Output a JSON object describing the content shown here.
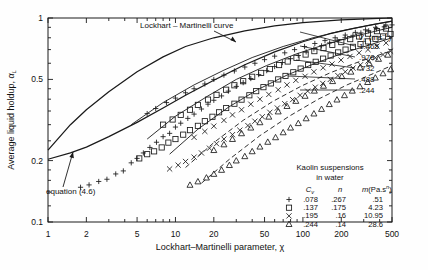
{
  "chart_data": {
    "type": "scatter",
    "title": "",
    "xlabel": "Lockhart–Martinelli parameter, χ",
    "ylabel": "Average liquid holdup, αL",
    "xscale": "log",
    "yscale": "log",
    "xlim": [
      1,
      500
    ],
    "ylim": [
      0.1,
      1
    ],
    "grid": false,
    "xticks": [
      1,
      2,
      5,
      10,
      20,
      50,
      100,
      200,
      500
    ],
    "xtick_labels": [
      "1",
      "2",
      "5",
      "10",
      "20",
      "50",
      "100",
      "200",
      "500"
    ],
    "yticks": [
      0.1,
      0.2,
      0.5,
      1
    ],
    "ytick_labels": [
      "0.1",
      "0.2",
      "0.5",
      "1"
    ],
    "annotations": [
      {
        "text": "Lockhart – Martinelli curve",
        "x": 3.2,
        "y": 0.82
      },
      {
        "text": "equation (4.6)",
        "x": 1.9,
        "y": 0.145
      }
    ],
    "reference_curves": [
      {
        "name": "Lockhart-Martinelli curve",
        "points": [
          [
            1,
            0.225
          ],
          [
            1.5,
            0.3
          ],
          [
            2,
            0.355
          ],
          [
            3,
            0.435
          ],
          [
            5,
            0.545
          ],
          [
            8,
            0.645
          ],
          [
            12,
            0.725
          ],
          [
            20,
            0.8
          ],
          [
            35,
            0.865
          ],
          [
            60,
            0.915
          ],
          [
            100,
            0.95
          ],
          [
            200,
            0.978
          ],
          [
            350,
            0.992
          ],
          [
            500,
            1.0
          ]
        ]
      },
      {
        "name": "equation (4.6)",
        "points": [
          [
            1,
            0.203
          ],
          [
            1.5,
            0.218
          ],
          [
            2,
            0.233
          ],
          [
            3,
            0.262
          ],
          [
            5,
            0.308
          ],
          [
            8,
            0.362
          ],
          [
            12,
            0.418
          ],
          [
            20,
            0.495
          ],
          [
            35,
            0.59
          ],
          [
            60,
            0.682
          ],
          [
            100,
            0.765
          ],
          [
            160,
            0.835
          ],
          [
            250,
            0.89
          ],
          [
            360,
            0.93
          ],
          [
            500,
            0.965
          ]
        ]
      }
    ],
    "series": [
      {
        "name": "Cv = .078",
        "marker": "plus",
        "n": ".267",
        "m": ".51",
        "points": [
          [
            1.8,
            0.148
          ],
          [
            2.1,
            0.152
          ],
          [
            2.5,
            0.158
          ],
          [
            2.9,
            0.162
          ],
          [
            3.4,
            0.172
          ],
          [
            3.9,
            0.178
          ],
          [
            4.5,
            0.195
          ],
          [
            5.0,
            0.205
          ],
          [
            5.6,
            0.218
          ],
          [
            6.3,
            0.232
          ],
          [
            7.1,
            0.246
          ],
          [
            8.0,
            0.262
          ],
          [
            9.0,
            0.272
          ],
          [
            10.0,
            0.292
          ],
          [
            11,
            0.305
          ],
          [
            12.5,
            0.322
          ],
          [
            14,
            0.338
          ],
          [
            16,
            0.358
          ],
          [
            18,
            0.378
          ],
          [
            20,
            0.395
          ],
          [
            23,
            0.415
          ],
          [
            26,
            0.438
          ],
          [
            30,
            0.462
          ],
          [
            34,
            0.482
          ],
          [
            39,
            0.505
          ],
          [
            45,
            0.528
          ],
          [
            52,
            0.552
          ],
          [
            60,
            0.578
          ],
          [
            69,
            0.605
          ],
          [
            80,
            0.632
          ],
          [
            92,
            0.655
          ],
          [
            106,
            0.682
          ],
          [
            122,
            0.705
          ],
          [
            140,
            0.73
          ],
          [
            162,
            0.755
          ],
          [
            186,
            0.778
          ],
          [
            214,
            0.8
          ],
          [
            247,
            0.822
          ],
          [
            285,
            0.845
          ],
          [
            328,
            0.865
          ],
          [
            378,
            0.885
          ],
          [
            435,
            0.905
          ],
          [
            500,
            0.925
          ],
          [
            6,
            0.34
          ],
          [
            7,
            0.36
          ],
          [
            8.5,
            0.385
          ],
          [
            10,
            0.405
          ],
          [
            12,
            0.43
          ],
          [
            14,
            0.45
          ],
          [
            17,
            0.475
          ],
          [
            20,
            0.5
          ],
          [
            24,
            0.525
          ],
          [
            29,
            0.55
          ],
          [
            35,
            0.575
          ],
          [
            42,
            0.6
          ],
          [
            50,
            0.625
          ],
          [
            60,
            0.65
          ],
          [
            72,
            0.675
          ],
          [
            86,
            0.7
          ],
          [
            103,
            0.725
          ],
          [
            124,
            0.75
          ],
          [
            149,
            0.775
          ],
          [
            179,
            0.8
          ],
          [
            215,
            0.825
          ],
          [
            258,
            0.85
          ],
          [
            310,
            0.875
          ],
          [
            372,
            0.9
          ],
          [
            447,
            0.925
          ]
        ]
      },
      {
        "name": "Cv = .137",
        "marker": "square",
        "n": ".175",
        "m": "4.23",
        "points": [
          [
            5.2,
            0.205
          ],
          [
            6.0,
            0.215
          ],
          [
            6.8,
            0.222
          ],
          [
            7.8,
            0.232
          ],
          [
            8.8,
            0.245
          ],
          [
            10,
            0.255
          ],
          [
            11.5,
            0.268
          ],
          [
            13,
            0.282
          ],
          [
            15,
            0.296
          ],
          [
            17,
            0.312
          ],
          [
            19.5,
            0.328
          ],
          [
            22,
            0.345
          ],
          [
            25,
            0.362
          ],
          [
            29,
            0.38
          ],
          [
            33,
            0.398
          ],
          [
            38,
            0.418
          ],
          [
            43,
            0.438
          ],
          [
            49,
            0.458
          ],
          [
            56,
            0.478
          ],
          [
            64,
            0.5
          ],
          [
            73,
            0.52
          ],
          [
            84,
            0.542
          ],
          [
            96,
            0.565
          ],
          [
            110,
            0.588
          ],
          [
            126,
            0.61
          ],
          [
            144,
            0.632
          ],
          [
            165,
            0.655
          ],
          [
            189,
            0.678
          ],
          [
            216,
            0.7
          ],
          [
            247,
            0.722
          ],
          [
            283,
            0.745
          ],
          [
            324,
            0.768
          ],
          [
            371,
            0.79
          ],
          [
            425,
            0.812
          ],
          [
            487,
            0.835
          ],
          [
            8,
            0.3
          ],
          [
            9.5,
            0.318
          ],
          [
            11,
            0.335
          ],
          [
            13,
            0.355
          ],
          [
            15,
            0.375
          ],
          [
            18,
            0.398
          ],
          [
            21,
            0.42
          ],
          [
            25,
            0.445
          ],
          [
            29,
            0.468
          ],
          [
            34,
            0.49
          ],
          [
            40,
            0.515
          ],
          [
            47,
            0.538
          ],
          [
            55,
            0.562
          ],
          [
            65,
            0.588
          ],
          [
            76,
            0.612
          ],
          [
            89,
            0.638
          ],
          [
            105,
            0.662
          ],
          [
            123,
            0.688
          ],
          [
            145,
            0.712
          ],
          [
            170,
            0.738
          ],
          [
            200,
            0.762
          ],
          [
            235,
            0.788
          ],
          [
            276,
            0.812
          ],
          [
            324,
            0.838
          ],
          [
            381,
            0.862
          ],
          [
            448,
            0.888
          ]
        ]
      },
      {
        "name": "Cv = .195",
        "marker": "cross",
        "n": ".16",
        "m": "10.95",
        "points": [
          [
            9,
            0.182
          ],
          [
            10.5,
            0.19
          ],
          [
            12,
            0.198
          ],
          [
            14,
            0.208
          ],
          [
            16,
            0.218
          ],
          [
            18.5,
            0.23
          ],
          [
            21,
            0.242
          ],
          [
            24,
            0.255
          ],
          [
            28,
            0.268
          ],
          [
            32,
            0.282
          ],
          [
            37,
            0.297
          ],
          [
            42,
            0.312
          ],
          [
            48,
            0.328
          ],
          [
            55,
            0.345
          ],
          [
            63,
            0.362
          ],
          [
            72,
            0.38
          ],
          [
            83,
            0.398
          ],
          [
            95,
            0.418
          ],
          [
            109,
            0.438
          ],
          [
            125,
            0.458
          ],
          [
            143,
            0.478
          ],
          [
            164,
            0.5
          ],
          [
            188,
            0.522
          ],
          [
            215,
            0.545
          ],
          [
            247,
            0.568
          ],
          [
            283,
            0.59
          ],
          [
            324,
            0.615
          ],
          [
            371,
            0.638
          ],
          [
            425,
            0.662
          ],
          [
            487,
            0.688
          ],
          [
            14,
            0.26
          ],
          [
            17,
            0.278
          ],
          [
            20,
            0.295
          ],
          [
            24,
            0.315
          ],
          [
            28,
            0.335
          ],
          [
            33,
            0.355
          ],
          [
            39,
            0.378
          ],
          [
            46,
            0.4
          ],
          [
            54,
            0.422
          ],
          [
            64,
            0.445
          ],
          [
            75,
            0.47
          ],
          [
            88,
            0.495
          ],
          [
            104,
            0.518
          ],
          [
            122,
            0.545
          ],
          [
            144,
            0.57
          ],
          [
            169,
            0.595
          ],
          [
            199,
            0.622
          ],
          [
            234,
            0.648
          ],
          [
            276,
            0.675
          ],
          [
            324,
            0.7
          ],
          [
            381,
            0.728
          ],
          [
            449,
            0.755
          ]
        ]
      },
      {
        "name": "Cv = .244",
        "marker": "triangle",
        "n": ".14",
        "m": "28.6",
        "points": [
          [
            13,
            0.152
          ],
          [
            15,
            0.158
          ],
          [
            17.5,
            0.165
          ],
          [
            20,
            0.172
          ],
          [
            23,
            0.18
          ],
          [
            26.5,
            0.19
          ],
          [
            30,
            0.2
          ],
          [
            35,
            0.21
          ],
          [
            40,
            0.222
          ],
          [
            46,
            0.234
          ],
          [
            53,
            0.247
          ],
          [
            61,
            0.26
          ],
          [
            70,
            0.275
          ],
          [
            80,
            0.29
          ],
          [
            92,
            0.305
          ],
          [
            106,
            0.322
          ],
          [
            122,
            0.34
          ],
          [
            140,
            0.358
          ],
          [
            161,
            0.378
          ],
          [
            185,
            0.398
          ],
          [
            212,
            0.418
          ],
          [
            244,
            0.44
          ],
          [
            280,
            0.462
          ],
          [
            322,
            0.485
          ],
          [
            370,
            0.51
          ],
          [
            425,
            0.535
          ],
          [
            488,
            0.56
          ],
          [
            20,
            0.225
          ],
          [
            24,
            0.24
          ],
          [
            28,
            0.255
          ],
          [
            33,
            0.272
          ],
          [
            39,
            0.29
          ],
          [
            46,
            0.308
          ],
          [
            54,
            0.328
          ],
          [
            64,
            0.348
          ],
          [
            75,
            0.37
          ],
          [
            88,
            0.392
          ],
          [
            104,
            0.415
          ],
          [
            123,
            0.44
          ],
          [
            145,
            0.465
          ],
          [
            171,
            0.49
          ],
          [
            202,
            0.518
          ],
          [
            238,
            0.545
          ],
          [
            281,
            0.572
          ],
          [
            332,
            0.6
          ],
          [
            392,
            0.63
          ],
          [
            463,
            0.66
          ]
        ]
      }
    ],
    "velocity_curves": {
      "header_symbol": "V",
      "header_sub": "L",
      "header_units": "(ms",
      "header_units_sup": "−1",
      "header_units_close": ")",
      "labels": [
        "1.465",
        ".976",
        ".732",
        ".488",
        ".244"
      ]
    },
    "legend": {
      "title_line1": "Kaolin suspensions",
      "title_line2": "in water",
      "col_headers": [
        "C",
        "n",
        "m"
      ],
      "col_header_cv_sub": "v",
      "col_header_m_unit": "(Pa.s",
      "col_header_m_unit_sup": "n",
      "col_header_m_unit_close": ")",
      "rows": [
        {
          "marker": "plus",
          "cv": ".078",
          "n": ".267",
          "m": ".51"
        },
        {
          "marker": "square",
          "cv": ".137",
          "n": ".175",
          "m": "4.23"
        },
        {
          "marker": "cross",
          "cv": ".195",
          "n": ".16",
          "m": "10.95"
        },
        {
          "marker": "triangle",
          "cv": ".244",
          "n": ".14",
          "m": "28.6"
        }
      ]
    }
  }
}
